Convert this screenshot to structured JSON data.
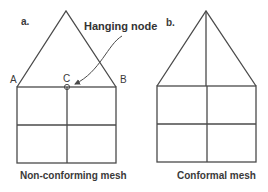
{
  "panels": [
    {
      "id": "a",
      "label": "a.",
      "caption": "Non-conforming mesh",
      "points": {
        "A": "A",
        "B": "B",
        "C": "C"
      },
      "annotation": "Hanging node"
    },
    {
      "id": "b",
      "label": "b.",
      "caption": "Conformal mesh"
    }
  ],
  "colors": {
    "line": "#4a4a4a",
    "text": "#3a3a3a",
    "background": "#ffffff"
  }
}
